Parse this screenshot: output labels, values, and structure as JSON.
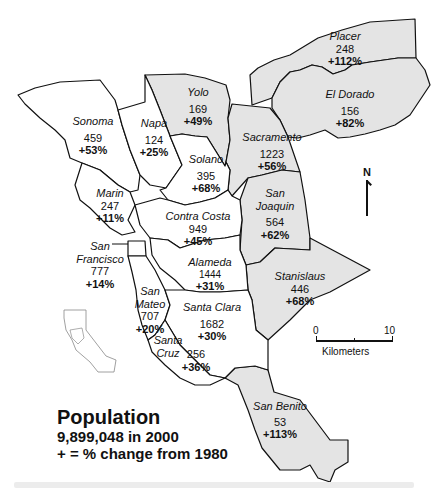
{
  "map": {
    "legend": {
      "title": "Population",
      "total_line": "9,899,048 in 2000",
      "change_line": "+ = % change from 1980"
    },
    "north_arrow": {
      "label": "N"
    },
    "scale_bar": {
      "start": "0",
      "end": "10",
      "unit": "Kilometers"
    },
    "colors": {
      "shaded_county": "#e4e4e4",
      "unshaded_county": "#ffffff",
      "outline": "#111111"
    },
    "counties": [
      {
        "name": "Sonoma",
        "population": "459",
        "change": "+53%",
        "shaded": false
      },
      {
        "name": "Napa",
        "population": "124",
        "change": "+25%",
        "shaded": false
      },
      {
        "name": "Yolo",
        "population": "169",
        "change": "+49%",
        "shaded": true
      },
      {
        "name": "Placer",
        "population": "248",
        "change": "+112%",
        "shaded": true
      },
      {
        "name": "El Dorado",
        "population": "156",
        "change": "+82%",
        "shaded": true
      },
      {
        "name": "Solano",
        "population": "395",
        "change": "+68%",
        "shaded": false
      },
      {
        "name": "Sacramento",
        "population": "1223",
        "change": "+56%",
        "shaded": true
      },
      {
        "name": "Marin",
        "population": "247",
        "change": "+11%",
        "shaded": false
      },
      {
        "name": "Contra Costa",
        "population": "949",
        "change": "+45%",
        "shaded": false
      },
      {
        "name": "San Joaquin",
        "population": "564",
        "change": "+62%",
        "shaded": true
      },
      {
        "name": "San Francisco",
        "population": "777",
        "change": "+14%",
        "shaded": false
      },
      {
        "name": "Alameda",
        "population": "1444",
        "change": "+31%",
        "shaded": false
      },
      {
        "name": "San Mateo",
        "population": "707",
        "change": "+20%",
        "shaded": false
      },
      {
        "name": "Santa Clara",
        "population": "1682",
        "change": "+30%",
        "shaded": false
      },
      {
        "name": "Stanislaus",
        "population": "446",
        "change": "+68%",
        "shaded": true
      },
      {
        "name": "Santa Cruz",
        "population": "256",
        "change": "+36%",
        "shaded": false
      },
      {
        "name": "San Benito",
        "population": "53",
        "change": "+113%",
        "shaded": true
      }
    ],
    "county_name_lines": {
      "san_francisco": [
        "San",
        "Francisco"
      ],
      "san_joaquin": [
        "San",
        "Joaquin"
      ],
      "san_mateo": [
        "San",
        "Mateo"
      ],
      "santa_cruz": [
        "Santa",
        "Cruz"
      ]
    }
  }
}
